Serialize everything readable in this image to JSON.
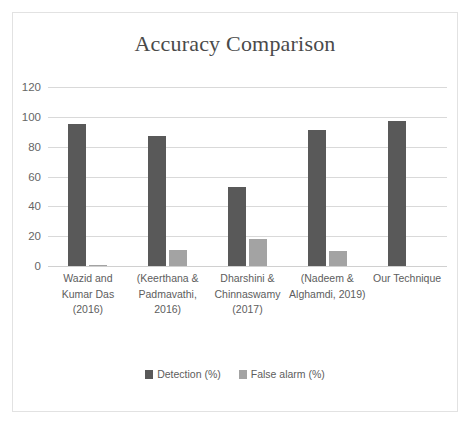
{
  "chart_data": {
    "type": "bar",
    "title": "Accuracy Comparison",
    "xlabel": "",
    "ylabel": "",
    "ylim": [
      0,
      120
    ],
    "yticks": [
      0,
      20,
      40,
      60,
      80,
      100,
      120
    ],
    "grid": true,
    "legend_position": "bottom",
    "categories": [
      "Wazid and Kumar Das (2016)",
      "(Keerthana & Padmavathi, 2016)",
      "Dharshini & Chinnaswamy (2017)",
      "(Nadeem & Alghamdi, 2019)",
      "Our Technique"
    ],
    "category_lines": [
      [
        "Wazid and",
        "Kumar Das",
        "(2016)"
      ],
      [
        "(Keerthana &",
        "Padmavathi,",
        "2016)"
      ],
      [
        "Dharshini &",
        "Chinnaswamy",
        "(2017)"
      ],
      [
        "(Nadeem &",
        "Alghamdi, 2019)"
      ],
      [
        "Our Technique"
      ]
    ],
    "series": [
      {
        "name": "Detection (%)",
        "color": "#595959",
        "values": [
          95,
          87,
          53,
          91,
          97
        ]
      },
      {
        "name": "False alarm (%)",
        "color": "#a3a3a3",
        "values": [
          1,
          11,
          18,
          10,
          0
        ]
      }
    ]
  },
  "legend": {
    "items": [
      {
        "label": "Detection (%)",
        "swatch": "detection"
      },
      {
        "label": "False alarm (%)",
        "swatch": "falsealarm"
      }
    ]
  },
  "colors": {
    "detection": "#595959",
    "false_alarm": "#a3a3a3",
    "gridline": "#d9d9d9",
    "frame_border": "#e2e2e2",
    "title_text": "#4a4a4a",
    "tick_text": "#666666"
  }
}
